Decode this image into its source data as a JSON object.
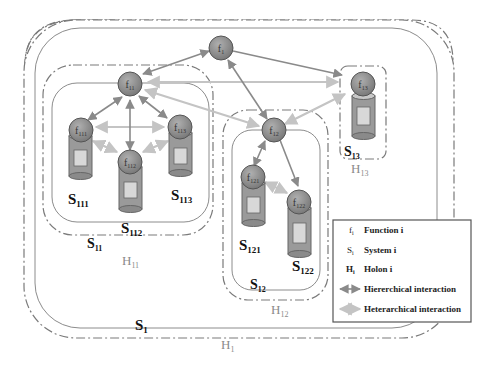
{
  "diagram": {
    "type": "holonic-system-architecture",
    "colors": {
      "holon_border": "#7a7a7a",
      "system_border": "#8c8c8c",
      "node_fill": "#8e8e8e",
      "node_stroke": "#555555",
      "cylinder_fill": "#9a9a9a",
      "cylinder_inner": "#d8d8d8",
      "hierarchical_arrow": "#8a8a8a",
      "heterarchical_arrow": "#c4c4c4",
      "holon_label": "#8a8a8a",
      "system_label": "#111111"
    },
    "functions": {
      "f1": {
        "base": "f",
        "sub": "1"
      },
      "f11": {
        "base": "f",
        "sub": "11"
      },
      "f12": {
        "base": "f",
        "sub": "12"
      },
      "f13": {
        "base": "f",
        "sub": "13"
      },
      "f111": {
        "base": "f",
        "sub": "111"
      },
      "f112": {
        "base": "f",
        "sub": "112"
      },
      "f113": {
        "base": "f",
        "sub": "113"
      },
      "f121": {
        "base": "f",
        "sub": "121"
      },
      "f122": {
        "base": "f",
        "sub": "122"
      }
    },
    "systems": {
      "S1": {
        "base": "S",
        "sub": "1"
      },
      "S11": {
        "base": "S",
        "sub": "11"
      },
      "S12": {
        "base": "S",
        "sub": "12"
      },
      "S13": {
        "base": "S",
        "sub": "13"
      },
      "S111": {
        "base": "S",
        "sub": "111"
      },
      "S112": {
        "base": "S",
        "sub": "112"
      },
      "S113": {
        "base": "S",
        "sub": "113"
      },
      "S121": {
        "base": "S",
        "sub": "121"
      },
      "S122": {
        "base": "S",
        "sub": "122"
      }
    },
    "holons": {
      "H1": {
        "base": "H",
        "sub": "1"
      },
      "H11": {
        "base": "H",
        "sub": "11"
      },
      "H12": {
        "base": "H",
        "sub": "12"
      },
      "H13": {
        "base": "H",
        "sub": "13"
      }
    },
    "hierarchical_links": [
      [
        "f1",
        "f11"
      ],
      [
        "f1",
        "f12"
      ],
      [
        "f1",
        "f13"
      ],
      [
        "f11",
        "f111"
      ],
      [
        "f11",
        "f112"
      ],
      [
        "f11",
        "f113"
      ],
      [
        "f12",
        "f121"
      ],
      [
        "f12",
        "f122"
      ]
    ],
    "heterarchical_links": [
      [
        "f11",
        "f12"
      ],
      [
        "f11",
        "f13"
      ],
      [
        "f12",
        "f13"
      ],
      [
        "f111",
        "f113"
      ],
      [
        "f111",
        "f112"
      ],
      [
        "f112",
        "f113"
      ],
      [
        "f121",
        "f122"
      ]
    ]
  },
  "legend": {
    "items": [
      {
        "symbol_base": "f",
        "symbol_sub": "i",
        "label": "Function  i"
      },
      {
        "symbol_base": "S",
        "symbol_sub": "i",
        "label": "System i"
      },
      {
        "symbol_base": "H",
        "symbol_sub": "i",
        "label": "Holon i"
      },
      {
        "symbol": "hierarchical-arrow",
        "label": "Hiererchical interaction"
      },
      {
        "symbol": "heterarchical-arrow",
        "label": "Heterarchical interaction"
      }
    ]
  }
}
